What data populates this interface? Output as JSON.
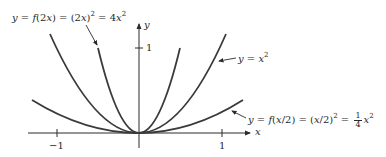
{
  "diagram": {
    "axes": {
      "x_label": "x",
      "y_label": "y",
      "x_ticks": [
        {
          "value": -1,
          "label": "−1"
        },
        {
          "value": 1,
          "label": "1"
        }
      ],
      "y_ticks": [
        {
          "value": 1,
          "label": "1"
        }
      ]
    },
    "curves": [
      {
        "name": "compressed",
        "expression": "y = 4x^2",
        "color": "#3a3a3a"
      },
      {
        "name": "base",
        "expression": "y = x^2",
        "color": "#3a3a3a"
      },
      {
        "name": "stretched",
        "expression": "y = (1/4)x^2",
        "color": "#3a3a3a"
      }
    ],
    "labels": {
      "compressed": {
        "y": "y",
        "eq1": " = ",
        "f": "f",
        "arg": "(2",
        "x": "x",
        "close": ")",
        "eq2": " = (2",
        "x2": "x",
        "paren": ")",
        "exp": "2",
        "eq3": " = 4",
        "x3": "x",
        "exp2": "2"
      },
      "base": {
        "y": "y",
        "eq": " = ",
        "x": "x",
        "exp": "2"
      },
      "stretched": {
        "y": "y",
        "eq1": " = ",
        "f": "f",
        "arg": "(",
        "x": "x",
        "div": "/2)",
        "eq2": " = (",
        "x2": "x",
        "div2": "/2)",
        "exp": "2",
        "eq3": " = ",
        "num": "1",
        "den": "4",
        "x3": "x",
        "exp2": "2"
      }
    }
  }
}
